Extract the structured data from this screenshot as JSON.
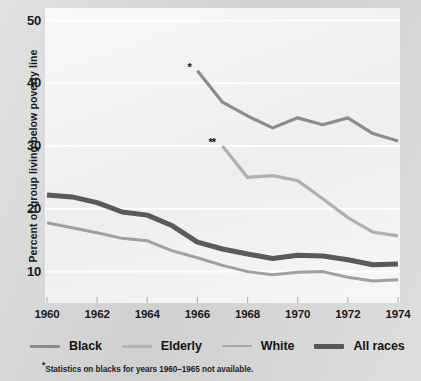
{
  "chart_data": {
    "type": "line",
    "title": "",
    "xlabel": "",
    "ylabel": "Percent of group living below poverty line",
    "xlim": [
      1960,
      1974
    ],
    "ylim": [
      5,
      52
    ],
    "yticks": [
      10,
      20,
      30,
      40,
      50
    ],
    "ytick_labels": [
      "10",
      "20",
      "30",
      "40",
      "50"
    ],
    "xticks": [
      1960,
      1962,
      1964,
      1966,
      1968,
      1970,
      1972,
      1974
    ],
    "xtick_labels": [
      "1960",
      "1962",
      "1964",
      "1966",
      "1968",
      "1970",
      "1972",
      "1974"
    ],
    "grid": "horizontal-white",
    "legend_position": "below-axes",
    "series": [
      {
        "name": "Black",
        "color": "#8c8c8c",
        "width": 3.2,
        "marker_note": "*",
        "x": [
          1966,
          1967,
          1968,
          1969,
          1970,
          1971,
          1972,
          1973,
          1974
        ],
        "values": [
          42.0,
          37.0,
          34.8,
          32.9,
          34.5,
          33.4,
          34.5,
          32.0,
          30.8
        ]
      },
      {
        "name": "Elderly",
        "color": "#b0b0b0",
        "width": 3.2,
        "marker_note": "**",
        "x": [
          1967,
          1968,
          1969,
          1970,
          1971,
          1972,
          1973,
          1974
        ],
        "values": [
          30.0,
          25.0,
          25.3,
          24.5,
          21.6,
          18.6,
          16.3,
          15.7
        ]
      },
      {
        "name": "White",
        "color": "#a0a0a0",
        "width": 3.0,
        "marker_note": "",
        "x": [
          1960,
          1961,
          1962,
          1963,
          1964,
          1965,
          1966,
          1967,
          1968,
          1969,
          1970,
          1971,
          1972,
          1973,
          1974
        ],
        "values": [
          17.8,
          17.0,
          16.2,
          15.3,
          14.9,
          13.3,
          12.2,
          11.0,
          10.0,
          9.5,
          9.9,
          10.0,
          9.1,
          8.5,
          8.7
        ]
      },
      {
        "name": "All races",
        "color": "#5a5a5a",
        "width": 5.0,
        "marker_note": "",
        "x": [
          1960,
          1961,
          1962,
          1963,
          1964,
          1965,
          1966,
          1967,
          1968,
          1969,
          1970,
          1971,
          1972,
          1973,
          1974
        ],
        "values": [
          22.2,
          21.9,
          21.0,
          19.5,
          19.0,
          17.3,
          14.7,
          13.6,
          12.8,
          12.1,
          12.6,
          12.5,
          11.9,
          11.1,
          11.2
        ]
      }
    ],
    "annotations": [
      {
        "text": "*",
        "x": 1966,
        "y": 42.0,
        "name": "black-series-asterisk"
      },
      {
        "text": "**",
        "x": 1967,
        "y": 30.0,
        "name": "elderly-series-asterisk"
      }
    ]
  },
  "legend": {
    "items": [
      {
        "label": "Black",
        "color": "#8c8c8c",
        "thickness": "3px"
      },
      {
        "label": "Elderly",
        "color": "#b3b3b3",
        "thickness": "3px"
      },
      {
        "label": "White",
        "color": "#a6a6a6",
        "thickness": "2px"
      },
      {
        "label": "All races",
        "color": "#575757",
        "thickness": "5px"
      }
    ]
  },
  "footnotes": [
    {
      "mark": "*",
      "text": "Statistics on blacks for years 1960–1965 not available."
    }
  ],
  "colors": {
    "page_background": "#d4d4d4",
    "plot_background": "#f0f0f0",
    "gridline": "#ffffff",
    "text": "#1a1a1a"
  }
}
